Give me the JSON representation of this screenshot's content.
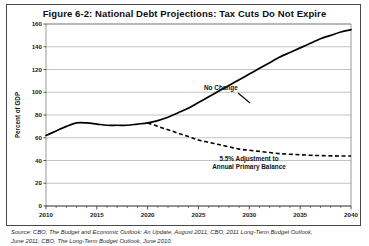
{
  "figure": {
    "title": "Figure 6-2: National Debt Projections: Tax Cuts Do Not Expire",
    "source_line_1": "Source: CBO, The Budget and Economic Outlook: An Update, August 2011; CBO, 2011 Long-Term Budget Outlook,",
    "source_line_2": "June 2011; CBO, The Long-Term Budget Outlook, June 2010."
  },
  "chart_data": {
    "type": "line",
    "title": "Figure 6-2: National Debt Projections: Tax Cuts Do Not Expire",
    "xlabel": "",
    "ylabel": "Percent of GDP",
    "xlim": [
      2010,
      2040
    ],
    "ylim": [
      0,
      160
    ],
    "grid": true,
    "legend_position": "inline-annotation",
    "x_ticks": [
      2010,
      2015,
      2020,
      2025,
      2030,
      2035,
      2040
    ],
    "x_minor_tick_step": 1,
    "y_ticks": [
      0,
      20,
      40,
      60,
      80,
      100,
      120,
      140,
      160
    ],
    "series": [
      {
        "name": "No Change",
        "style": "solid",
        "annotation": "No Change",
        "x": [
          2010,
          2011,
          2012,
          2013,
          2014,
          2015,
          2016,
          2017,
          2018,
          2019,
          2020,
          2021,
          2022,
          2023,
          2024,
          2025,
          2026,
          2027,
          2028,
          2029,
          2030,
          2031,
          2032,
          2033,
          2034,
          2035,
          2036,
          2037,
          2038,
          2039,
          2040
        ],
        "values": [
          62,
          66,
          70,
          73,
          73,
          72,
          71,
          71,
          71,
          72,
          73,
          75,
          78,
          82,
          86,
          91,
          96,
          101,
          106,
          111,
          116,
          121,
          126,
          131,
          135,
          139,
          143,
          147,
          150,
          153,
          155
        ]
      },
      {
        "name": "5.5% Adjustment to Annual Primary Balance",
        "style": "dashed",
        "annotation_line_1": "5.5% Adjustment to",
        "annotation_line_2": "Annual Primary Balance",
        "x": [
          2020,
          2021,
          2022,
          2023,
          2024,
          2025,
          2026,
          2027,
          2028,
          2029,
          2030,
          2031,
          2032,
          2033,
          2034,
          2035,
          2036,
          2037,
          2038,
          2039,
          2040
        ],
        "values": [
          73,
          70,
          67,
          64,
          61,
          58,
          56,
          54,
          52,
          50,
          49,
          48,
          47,
          46,
          45.5,
          45,
          44.6,
          44.3,
          44.1,
          44,
          44
        ]
      }
    ]
  },
  "annotations": {
    "no_change_label": "No Change",
    "adjustment_label_line1": "5.5% Adjustment to",
    "adjustment_label_line2": "Annual Primary Balance"
  },
  "colors": {
    "series_stroke": "#000000",
    "grid": "#9a9a9a",
    "axis": "#2b2b2b",
    "background": "#ffffff"
  }
}
